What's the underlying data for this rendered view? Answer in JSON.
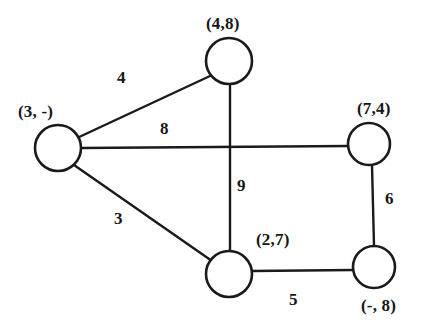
{
  "figure": {
    "background_color": "#ffffff",
    "ink_color": "#1a1a1a"
  },
  "graph": {
    "type": "undirected-weighted-graph",
    "nodes": [
      {
        "id": "top",
        "label": "(4,8)",
        "cx": 229,
        "cy": 61,
        "r": 23,
        "label_x": 206,
        "label_y": 15
      },
      {
        "id": "left",
        "label": "(3, -)",
        "cx": 58,
        "cy": 148,
        "r": 23,
        "label_x": 18,
        "label_y": 103
      },
      {
        "id": "right",
        "label": "(7,4)",
        "cx": 369,
        "cy": 144,
        "r": 21,
        "label_x": 357,
        "label_y": 100
      },
      {
        "id": "bottom-mid",
        "label": "(2,7)",
        "cx": 229,
        "cy": 274,
        "r": 23,
        "label_x": 256,
        "label_y": 231
      },
      {
        "id": "bottom-right",
        "label": "(-, 8)",
        "cx": 374,
        "cy": 267,
        "r": 21,
        "label_x": 361,
        "label_y": 297
      }
    ],
    "edges": [
      {
        "id": "left-top",
        "from": "left",
        "to": "top",
        "weight": "4",
        "x1": 77,
        "y1": 138,
        "x2": 210,
        "y2": 76,
        "label_x": 117,
        "label_y": 69
      },
      {
        "id": "left-right",
        "from": "left",
        "to": "right",
        "weight": "8",
        "x1": 81,
        "y1": 148,
        "x2": 348,
        "y2": 146,
        "label_x": 160,
        "label_y": 120
      },
      {
        "id": "left-bottom-mid",
        "from": "left",
        "to": "bottom-mid",
        "weight": "3",
        "x1": 74,
        "y1": 165,
        "x2": 212,
        "y2": 261,
        "label_x": 114,
        "label_y": 210
      },
      {
        "id": "top-bottom-mid",
        "from": "top",
        "to": "bottom-mid",
        "weight": "9",
        "x1": 230,
        "y1": 84,
        "x2": 230,
        "y2": 252,
        "label_x": 237,
        "label_y": 177
      },
      {
        "id": "right-bottom-right",
        "from": "right",
        "to": "bottom-right",
        "weight": "6",
        "x1": 372,
        "y1": 165,
        "x2": 374,
        "y2": 246,
        "label_x": 385,
        "label_y": 190
      },
      {
        "id": "bottom-mid-bottom-right",
        "from": "bottom-mid",
        "to": "bottom-right",
        "weight": "5",
        "x1": 252,
        "y1": 271,
        "x2": 353,
        "y2": 270,
        "label_x": 289,
        "label_y": 291
      }
    ]
  }
}
